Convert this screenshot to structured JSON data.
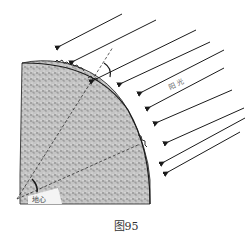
{
  "figure": {
    "labels": {
      "sunlight": "阳 光",
      "earth_center": "地心"
    },
    "caption": "图95",
    "colors": {
      "ink": "#1a1a1a",
      "earth_fill": "#b8b8b8",
      "background": "#ffffff"
    }
  }
}
